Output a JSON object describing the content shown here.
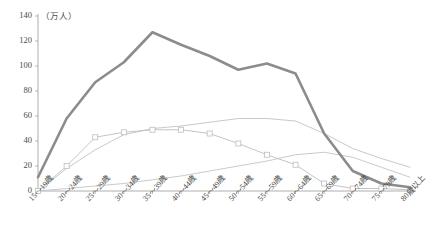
{
  "chart_data": {
    "type": "line",
    "title": "",
    "subtitle": "",
    "xlabel": "",
    "ylabel": "",
    "unit_label": "（万人）",
    "ylim": [
      0,
      140
    ],
    "yticks": [
      0,
      20,
      40,
      60,
      80,
      100,
      120,
      140
    ],
    "grid": false,
    "legend": "none",
    "categories": [
      "15〜19歳",
      "20〜24歳",
      "25〜29歳",
      "30〜34歳",
      "35〜39歳",
      "40〜44歳",
      "45〜49歳",
      "50〜54歳",
      "55〜59歳",
      "60〜64歳",
      "65〜69歳",
      "70〜74歳",
      "75〜79歳",
      "80歳以上"
    ],
    "series": [
      {
        "name": "総数",
        "color": "#8c8c8c",
        "width": 2.6,
        "marker": "none",
        "values": [
          11,
          58,
          87,
          103,
          127,
          117,
          108,
          97,
          102,
          94,
          46,
          16,
          6,
          3
        ]
      },
      {
        "name": "系列2",
        "color": "#c9c9c9",
        "width": 1.0,
        "marker": "none",
        "values": [
          0,
          18,
          33,
          45,
          50,
          52,
          55,
          58,
          58,
          56,
          46,
          34,
          26,
          19
        ]
      },
      {
        "name": "系列3",
        "color": "#bdbdbd",
        "width": 0.9,
        "marker": "square",
        "values": [
          0,
          20,
          43,
          47,
          49,
          49,
          46,
          38,
          29,
          21,
          6,
          2,
          2,
          1
        ]
      },
      {
        "name": "系列4",
        "color": "#c4c4c4",
        "width": 0.9,
        "marker": "none",
        "values": [
          0,
          2,
          4,
          6,
          9,
          12,
          16,
          20,
          24,
          29,
          31,
          27,
          19,
          11
        ]
      }
    ]
  },
  "axis": {
    "y_tick_labels": [
      "140",
      "120",
      "100",
      "80",
      "60",
      "40",
      "20",
      "0"
    ]
  }
}
